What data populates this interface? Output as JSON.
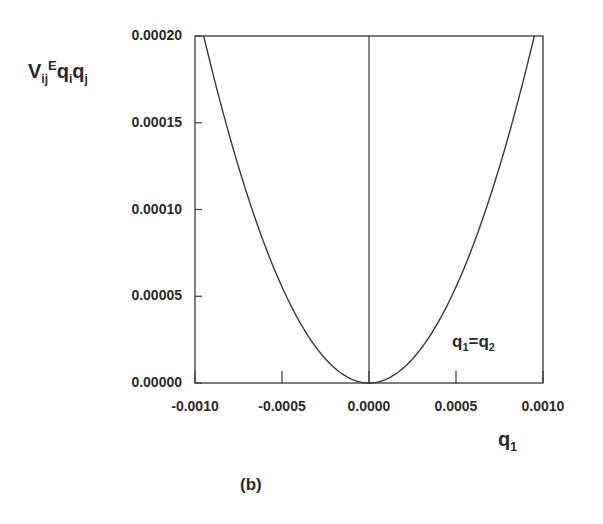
{
  "chart_data": {
    "type": "line",
    "title": "",
    "panel_label": "(b)",
    "xlabel": "q1",
    "ylabel": "V_ij^E q_i q_j",
    "xlim": [
      -0.001,
      0.001
    ],
    "ylim": [
      0.0,
      0.0002
    ],
    "x_ticks": [
      "-0.0010",
      "-0.0005",
      "0.0000",
      "0.0005",
      "0.0010"
    ],
    "y_ticks": [
      "0.00000",
      "0.00005",
      "0.00010",
      "0.00015",
      "0.00020"
    ],
    "grid": false,
    "annotations": [
      "q1=q2",
      "vertical line at q1 = 0"
    ],
    "series": [
      {
        "name": "V_ij^E q_i q_j (q1=q2)",
        "x": [
          -0.00095,
          -0.0008,
          -0.0006,
          -0.0004,
          -0.0002,
          0.0,
          0.0002,
          0.0004,
          0.0006,
          0.0008,
          0.00095
        ],
        "y": [
          0.0002,
          0.000142,
          8e-05,
          3.6e-05,
          9e-06,
          0.0,
          9e-06,
          3.6e-05,
          8e-05,
          0.000142,
          0.0002
        ]
      }
    ]
  },
  "labels": {
    "ylabel_main": "V",
    "ylabel_sub1": "ij",
    "ylabel_sup": "E",
    "ylabel_q1": "q",
    "ylabel_sub2": "i",
    "ylabel_q2": "q",
    "ylabel_sub3": "j",
    "xlabel_main": "q",
    "xlabel_sub": "1",
    "annot_q": "q",
    "annot_sub1": "1",
    "annot_eq": "=q",
    "annot_sub2": "2",
    "panel": "(b)"
  }
}
